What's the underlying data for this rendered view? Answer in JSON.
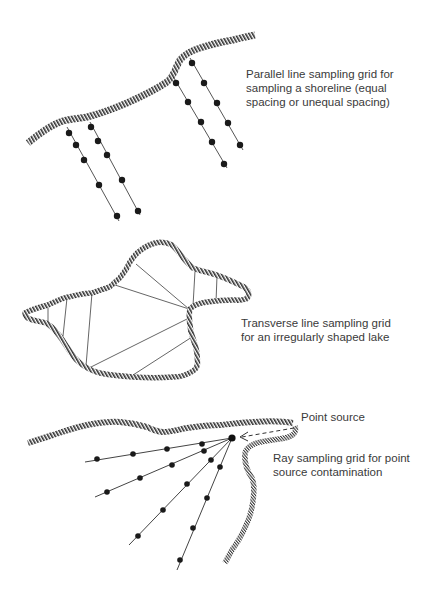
{
  "panels": [
    {
      "id": "parallel",
      "caption_lines": [
        "Parallel line sampling grid for",
        "sampling a shoreline (equal",
        "spacing or unequal spacing)"
      ]
    },
    {
      "id": "transverse",
      "caption_lines": [
        "Transverse line sampling grid",
        "for an irregularly shaped lake"
      ]
    },
    {
      "id": "ray",
      "caption_lines": [
        "Ray sampling grid for point",
        "source contamination"
      ],
      "point_source_label": "Point source"
    }
  ],
  "colors": {
    "shore_stripe": "#2e2e2e",
    "line": "#444444",
    "dot": "#1a1a1a",
    "text": "#3a3a3a"
  }
}
